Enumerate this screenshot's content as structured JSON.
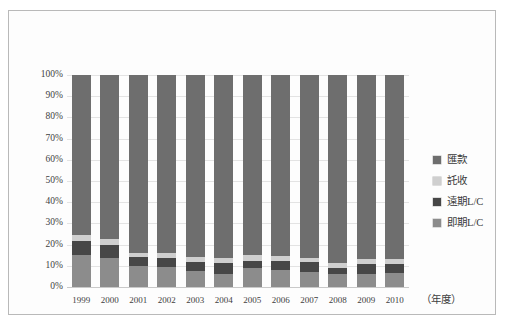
{
  "chart_data": {
    "type": "bar",
    "stacked": true,
    "normalized": true,
    "title": "",
    "xlabel": "（年度）",
    "ylabel": "",
    "ylim": [
      0,
      100
    ],
    "ytick_labels": [
      "100%",
      "90%",
      "80%",
      "70%",
      "60%",
      "50%",
      "40%",
      "30%",
      "20%",
      "10%",
      "0%"
    ],
    "ytick_values": [
      100,
      90,
      80,
      70,
      60,
      50,
      40,
      30,
      20,
      10,
      0
    ],
    "grid": true,
    "legend_position": "right",
    "categories": [
      "1999",
      "2000",
      "2001",
      "2002",
      "2003",
      "2004",
      "2005",
      "2006",
      "2007",
      "2008",
      "2009",
      "2010"
    ],
    "series": [
      {
        "name": "即期L/C",
        "color": "#8c8c8c",
        "values": [
          15.0,
          13.5,
          10.0,
          9.5,
          7.5,
          6.0,
          9.0,
          8.0,
          7.0,
          6.0,
          6.0,
          6.5
        ]
      },
      {
        "name": "遠期L/C",
        "color": "#474747",
        "values": [
          6.5,
          6.5,
          4.0,
          4.0,
          4.5,
          5.5,
          3.5,
          4.5,
          5.0,
          3.0,
          5.0,
          4.5
        ]
      },
      {
        "name": "託收",
        "color": "#cfcfcf",
        "values": [
          3.0,
          2.5,
          2.0,
          2.5,
          2.0,
          2.0,
          2.5,
          2.0,
          1.5,
          2.5,
          2.0,
          2.0
        ]
      },
      {
        "name": "匯款",
        "color": "#6e6e6e",
        "values": [
          75.5,
          77.5,
          84.0,
          84.0,
          86.0,
          86.5,
          85.0,
          85.5,
          86.5,
          88.5,
          87.0,
          87.0
        ]
      }
    ]
  },
  "legend": {
    "items": [
      {
        "label": "匯款",
        "swatch_class": "s3"
      },
      {
        "label": "託收",
        "swatch_class": "s2"
      },
      {
        "label": "遠期L/C",
        "swatch_class": "s1"
      },
      {
        "label": "即期L/C",
        "swatch_class": "s0"
      }
    ]
  }
}
